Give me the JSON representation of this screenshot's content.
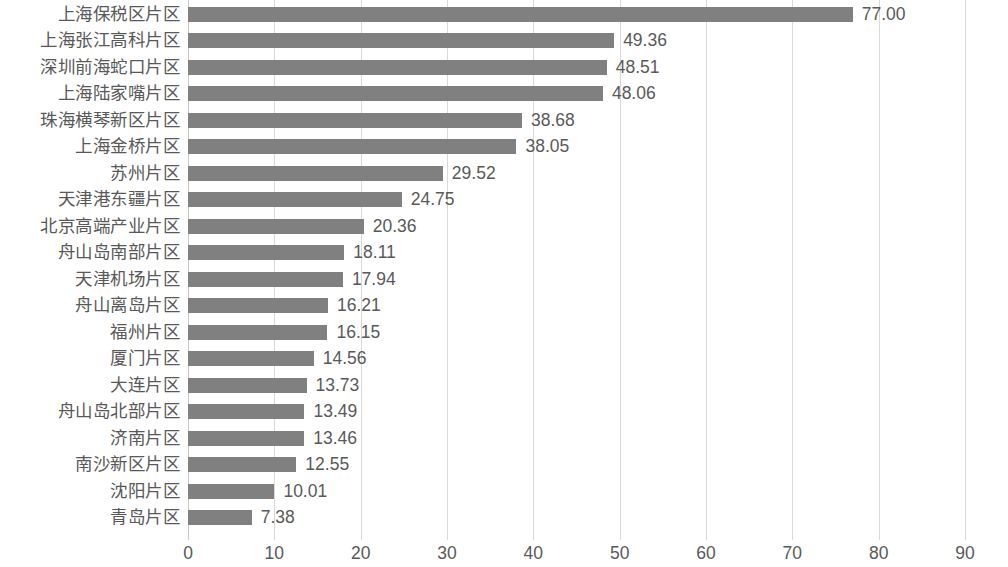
{
  "chart_data": {
    "type": "bar",
    "orientation": "horizontal",
    "title": "",
    "subtitle": "",
    "xlabel": "",
    "ylabel": "",
    "xlim": [
      0,
      90
    ],
    "xticks": [
      "0",
      "10",
      "20",
      "30",
      "40",
      "50",
      "60",
      "70",
      "80",
      "90"
    ],
    "xtick_values": [
      0,
      10,
      20,
      30,
      40,
      50,
      60,
      70,
      80,
      90
    ],
    "grid": true,
    "grid_axis": "x",
    "legend": false,
    "legend_position": "none",
    "bar_color": "#808080",
    "text_color": "#595959",
    "gridline_color": "#d9d9d9",
    "background": "#ffffff",
    "categories": [
      "上海保税区片区",
      "上海张江高科片区",
      "深圳前海蛇口片区",
      "上海陆家嘴片区",
      "珠海横琴新区片区",
      "上海金桥片区",
      "苏州片区",
      "天津港东疆片区",
      "北京高端产业片区",
      "舟山岛南部片区",
      "天津机场片区",
      "舟山离岛片区",
      "福州片区",
      "厦门片区",
      "大连片区",
      "舟山岛北部片区",
      "济南片区",
      "南沙新区片区",
      "沈阳片区",
      "青岛片区"
    ],
    "values": [
      77.0,
      49.36,
      48.51,
      48.06,
      38.68,
      38.05,
      29.52,
      24.75,
      20.36,
      18.11,
      17.94,
      16.21,
      16.15,
      14.56,
      13.73,
      13.49,
      13.46,
      12.55,
      10.01,
      7.38
    ],
    "value_labels": [
      "77.00",
      "49.36",
      "48.51",
      "48.06",
      "38.68",
      "38.05",
      "29.52",
      "24.75",
      "20.36",
      "18.11",
      "17.94",
      "16.21",
      "16.15",
      "14.56",
      "13.73",
      "13.49",
      "13.46",
      "12.55",
      "10.01",
      "7.38"
    ]
  }
}
